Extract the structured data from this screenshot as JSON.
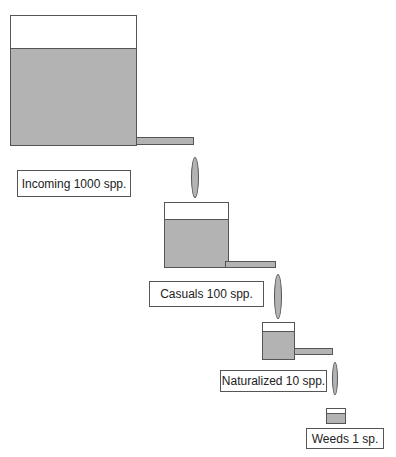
{
  "diagram": {
    "title": "",
    "stages": [
      {
        "id": "incoming",
        "label": "Incoming 1000 spp."
      },
      {
        "id": "casuals",
        "label": "Casuals 100 spp."
      },
      {
        "id": "naturalized",
        "label": "Naturalized 10 spp."
      },
      {
        "id": "weeds",
        "label": "Weeds 1 sp."
      }
    ],
    "colors": {
      "fill": "#b3b3b3",
      "stroke": "#555555",
      "background": "#ffffff"
    }
  }
}
